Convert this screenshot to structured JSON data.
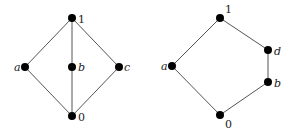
{
  "diagrams": [
    {
      "name": "M3 lattice (diamond)",
      "nodes": [
        {
          "id": "1",
          "label": "1",
          "italic": false,
          "x": 72,
          "y": 18,
          "lx": 78,
          "ly": 23
        },
        {
          "id": "a",
          "label": "a",
          "italic": true,
          "x": 25,
          "y": 67,
          "lx": 14,
          "ly": 71
        },
        {
          "id": "b",
          "label": "b",
          "italic": true,
          "x": 72,
          "y": 67,
          "lx": 78,
          "ly": 71
        },
        {
          "id": "c",
          "label": "c",
          "italic": true,
          "x": 119,
          "y": 67,
          "lx": 124,
          "ly": 71
        },
        {
          "id": "0",
          "label": "0",
          "italic": false,
          "x": 72,
          "y": 116,
          "lx": 78,
          "ly": 121
        }
      ],
      "edges": [
        [
          "1",
          "a"
        ],
        [
          "1",
          "b"
        ],
        [
          "1",
          "c"
        ],
        [
          "a",
          "0"
        ],
        [
          "b",
          "0"
        ],
        [
          "c",
          "0"
        ]
      ]
    },
    {
      "name": "N5 lattice (pentagon)",
      "nodes": [
        {
          "id": "1",
          "label": "1",
          "italic": false,
          "x": 220,
          "y": 18,
          "lx": 225,
          "ly": 13
        },
        {
          "id": "a",
          "label": "a",
          "italic": true,
          "x": 172,
          "y": 66,
          "lx": 161,
          "ly": 70
        },
        {
          "id": "d",
          "label": "d",
          "italic": true,
          "x": 268,
          "y": 50,
          "lx": 274,
          "ly": 55
        },
        {
          "id": "b",
          "label": "b",
          "italic": true,
          "x": 268,
          "y": 82,
          "lx": 274,
          "ly": 87
        },
        {
          "id": "0",
          "label": "0",
          "italic": false,
          "x": 220,
          "y": 115,
          "lx": 225,
          "ly": 128
        }
      ],
      "edges": [
        [
          "1",
          "a"
        ],
        [
          "1",
          "d"
        ],
        [
          "d",
          "b"
        ],
        [
          "b",
          "0"
        ],
        [
          "a",
          "0"
        ]
      ]
    }
  ],
  "style": {
    "node_color": "#000000",
    "edge_color": "#555555",
    "node_radius": 4
  }
}
